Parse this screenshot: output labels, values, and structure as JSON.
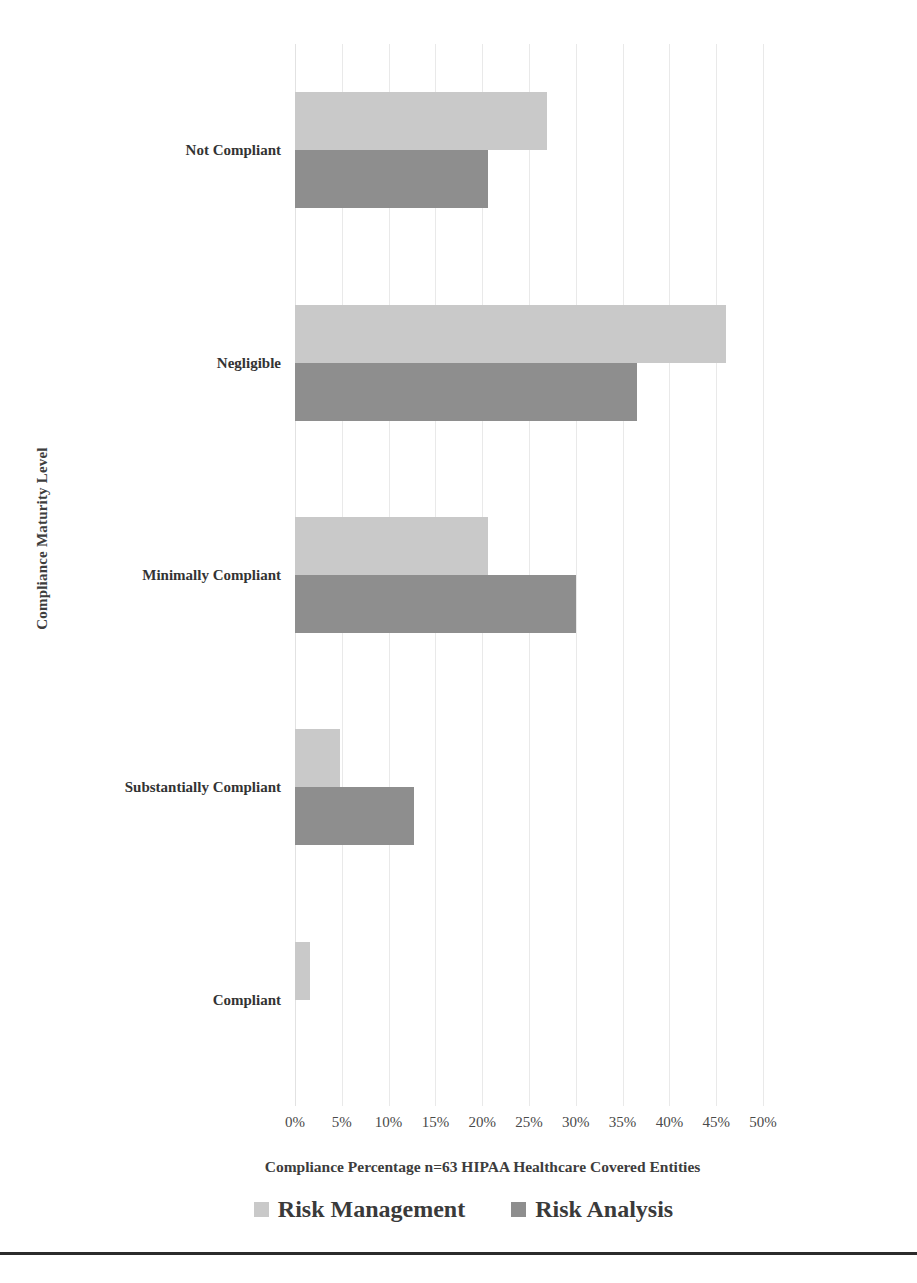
{
  "chart_data": {
    "type": "bar",
    "orientation": "horizontal",
    "title": "",
    "xlabel": "Compliance Percentage n=63 HIPAA Healthcare Covered Entities",
    "ylabel": "Compliance Maturity Level",
    "categories": [
      "Compliant",
      "Substantially Compliant",
      "Minimally Compliant",
      "Negligible",
      "Not Compliant"
    ],
    "series": [
      {
        "name": "Risk Management",
        "color": "#c9c9c9",
        "values": [
          1.6,
          4.8,
          20.6,
          46.0,
          26.9
        ]
      },
      {
        "name": "Risk Analysis",
        "color": "#8e8e8e",
        "values": [
          0,
          12.7,
          30.0,
          36.5,
          20.6
        ]
      }
    ],
    "xlim": [
      0,
      50
    ],
    "x_ticks": [
      "0%",
      "5%",
      "10%",
      "15%",
      "20%",
      "25%",
      "30%",
      "35%",
      "40%",
      "45%",
      "50%"
    ],
    "x_tick_values": [
      0,
      5,
      10,
      15,
      20,
      25,
      30,
      35,
      40,
      45,
      50
    ],
    "grid": true,
    "grid_axis": "x",
    "legend_position": "bottom",
    "legend": [
      "Risk Management",
      "Risk Analysis"
    ]
  },
  "colors": {
    "series_risk_management": "#c9c9c9",
    "series_risk_analysis": "#8e8e8e",
    "gridline": "#e9e9e9",
    "text": "#3a3a3a",
    "rule": "#2b2b2b"
  }
}
